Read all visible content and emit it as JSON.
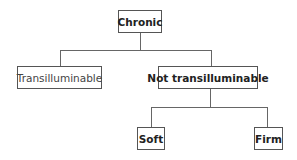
{
  "diagram": {
    "type": "tree",
    "root": {
      "label": "Chronic"
    },
    "level1": [
      {
        "label": "Transilluminable"
      },
      {
        "label": "Not transilluminable"
      }
    ],
    "level2": [
      {
        "label": "Soft"
      },
      {
        "label": "Firm"
      }
    ],
    "edges": [
      [
        "Chronic",
        "Transilluminable"
      ],
      [
        "Chronic",
        "Not transilluminable"
      ],
      [
        "Not transilluminable",
        "Soft"
      ],
      [
        "Not transilluminable",
        "Firm"
      ]
    ]
  }
}
